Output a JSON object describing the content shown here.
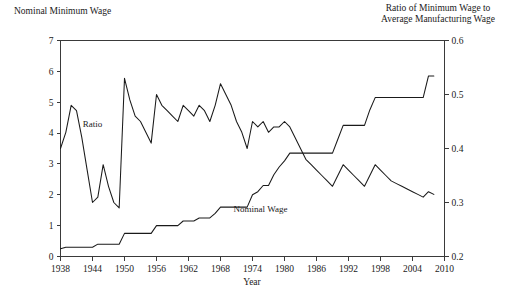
{
  "figure": {
    "left_axis_title": "Nominal Minimum Wage",
    "right_axis_title_line1": "Ratio of Minimum Wage to",
    "right_axis_title_line2": "Average Manufacturing Wage",
    "xlabel": "Year",
    "series_label_ratio": "Ratio",
    "series_label_wage": "Nominal Wage",
    "line_color": "#1a1a1a",
    "axis_color": "#3a3a3a",
    "background": "#ffffff"
  },
  "chart_data": {
    "type": "line",
    "title": "",
    "subtitle": "",
    "xlabel": "Year",
    "ylabel": "Nominal Minimum Wage",
    "y2label": "Ratio of Minimum Wage to Average Manufacturing Wage",
    "xlim": [
      1938,
      2010
    ],
    "ylim": [
      0,
      7
    ],
    "y2lim": [
      0.2,
      0.6
    ],
    "xticks": [
      1938,
      1944,
      1950,
      1956,
      1962,
      1968,
      1974,
      1980,
      1986,
      1992,
      1998,
      2004,
      2010
    ],
    "yticks": [
      0,
      1,
      2,
      3,
      4,
      5,
      6,
      7
    ],
    "y2ticks": [
      0.2,
      0.3,
      0.4,
      0.5,
      0.6
    ],
    "grid": false,
    "legend_position": "inline-annotation",
    "annotations": [
      {
        "text": "Ratio",
        "x": 1944.0,
        "y_axis": "right",
        "y": 0.44
      },
      {
        "text": "Nominal Wage",
        "x": 1975.5,
        "y_axis": "left",
        "y": 1.45
      }
    ],
    "series": [
      {
        "name": "Nominal Wage",
        "axis": "left",
        "units": "dollars per hour",
        "x": [
          1938,
          1939,
          1940,
          1941,
          1942,
          1943,
          1944,
          1945,
          1946,
          1947,
          1948,
          1949,
          1950,
          1951,
          1952,
          1953,
          1954,
          1955,
          1956,
          1957,
          1958,
          1959,
          1960,
          1961,
          1962,
          1963,
          1964,
          1965,
          1966,
          1967,
          1968,
          1969,
          1970,
          1971,
          1972,
          1973,
          1974,
          1975,
          1976,
          1977,
          1978,
          1979,
          1980,
          1981,
          1982,
          1983,
          1984,
          1985,
          1986,
          1987,
          1988,
          1989,
          1990,
          1991,
          1992,
          1993,
          1994,
          1995,
          1996,
          1997,
          1998,
          1999,
          2000,
          2001,
          2002,
          2003,
          2004,
          2005,
          2006,
          2007,
          2008
        ],
        "values": [
          0.25,
          0.3,
          0.3,
          0.3,
          0.3,
          0.3,
          0.3,
          0.4,
          0.4,
          0.4,
          0.4,
          0.4,
          0.75,
          0.75,
          0.75,
          0.75,
          0.75,
          0.75,
          1.0,
          1.0,
          1.0,
          1.0,
          1.0,
          1.15,
          1.15,
          1.15,
          1.25,
          1.25,
          1.25,
          1.4,
          1.6,
          1.6,
          1.6,
          1.6,
          1.6,
          1.6,
          2.0,
          2.1,
          2.3,
          2.3,
          2.65,
          2.9,
          3.1,
          3.35,
          3.35,
          3.35,
          3.35,
          3.35,
          3.35,
          3.35,
          3.35,
          3.35,
          3.8,
          4.25,
          4.25,
          4.25,
          4.25,
          4.25,
          4.75,
          5.15,
          5.15,
          5.15,
          5.15,
          5.15,
          5.15,
          5.15,
          5.15,
          5.15,
          5.15,
          5.85,
          5.85
        ]
      },
      {
        "name": "Ratio",
        "axis": "right",
        "units": "fraction",
        "x": [
          1938,
          1939,
          1940,
          1941,
          1942,
          1943,
          1944,
          1945,
          1946,
          1947,
          1948,
          1949,
          1950,
          1951,
          1952,
          1953,
          1954,
          1955,
          1956,
          1957,
          1958,
          1959,
          1960,
          1961,
          1962,
          1963,
          1964,
          1965,
          1966,
          1967,
          1968,
          1969,
          1970,
          1971,
          1972,
          1973,
          1974,
          1975,
          1976,
          1977,
          1978,
          1979,
          1980,
          1981,
          1982,
          1983,
          1984,
          1985,
          1986,
          1987,
          1988,
          1989,
          1990,
          1991,
          1992,
          1993,
          1994,
          1995,
          1996,
          1997,
          1998,
          1999,
          2000,
          2001,
          2002,
          2003,
          2004,
          2005,
          2006,
          2007,
          2008
        ],
        "values": [
          0.4,
          0.43,
          0.48,
          0.47,
          0.42,
          0.36,
          0.3,
          0.31,
          0.37,
          0.33,
          0.3,
          0.29,
          0.53,
          0.49,
          0.46,
          0.45,
          0.43,
          0.41,
          0.5,
          0.48,
          0.47,
          0.46,
          0.45,
          0.48,
          0.47,
          0.46,
          0.48,
          0.47,
          0.45,
          0.48,
          0.52,
          0.5,
          0.48,
          0.45,
          0.43,
          0.4,
          0.45,
          0.44,
          0.45,
          0.43,
          0.44,
          0.44,
          0.45,
          0.44,
          0.42,
          0.4,
          0.38,
          0.37,
          0.36,
          0.35,
          0.34,
          0.33,
          0.35,
          0.37,
          0.36,
          0.35,
          0.34,
          0.33,
          0.35,
          0.37,
          0.36,
          0.35,
          0.34,
          0.335,
          0.33,
          0.325,
          0.32,
          0.315,
          0.31,
          0.32,
          0.315
        ]
      }
    ]
  }
}
